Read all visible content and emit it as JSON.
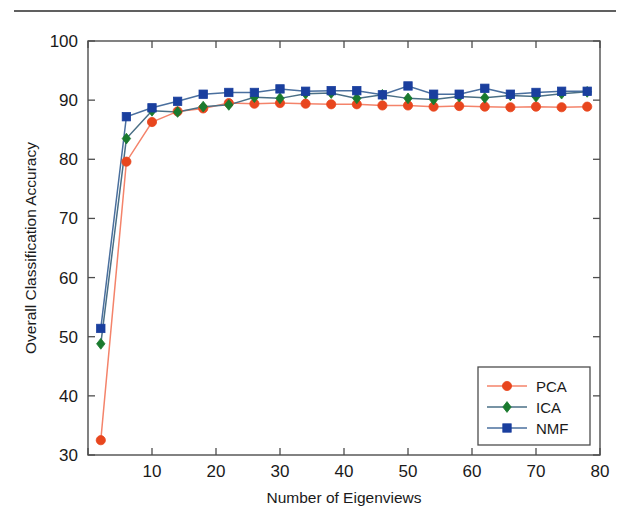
{
  "figure": {
    "top_rule_color": "#606060",
    "background": "#ffffff",
    "axis_color": "#4d4d4d"
  },
  "chart_data": {
    "type": "line",
    "title": "",
    "subtitle": "",
    "xlabel": "Number of Eigenviews",
    "ylabel": "Overall Classification Accuracy",
    "xlim": [
      0,
      80
    ],
    "ylim": [
      30,
      100
    ],
    "xticks": [
      0,
      10,
      20,
      30,
      40,
      50,
      60,
      70,
      80
    ],
    "xtick_labels": [
      "",
      "10",
      "20",
      "30",
      "40",
      "50",
      "60",
      "70",
      "80"
    ],
    "yticks": [
      30,
      40,
      50,
      60,
      70,
      80,
      90,
      100
    ],
    "ytick_labels": [
      "30",
      "40",
      "50",
      "60",
      "70",
      "80",
      "90",
      "100"
    ],
    "grid": false,
    "legend_position": "lower right",
    "x": [
      2,
      6,
      10,
      14,
      18,
      22,
      26,
      30,
      34,
      38,
      42,
      46,
      50,
      54,
      58,
      62,
      66,
      70,
      74,
      78
    ],
    "series": [
      {
        "name": "PCA",
        "color": "#e8461e",
        "line_color": "#f4836a",
        "marker": "circle",
        "values": [
          32.5,
          79.6,
          86.3,
          88.1,
          88.6,
          89.5,
          89.4,
          89.5,
          89.4,
          89.3,
          89.3,
          89.1,
          89.1,
          88.9,
          89.0,
          88.9,
          88.8,
          88.9,
          88.8,
          88.9
        ]
      },
      {
        "name": "ICA",
        "color": "#1a7a2e",
        "line_color": "#4a6f86",
        "marker": "diamond",
        "values": [
          48.8,
          83.5,
          88.2,
          88.0,
          88.9,
          89.2,
          90.5,
          90.3,
          91.1,
          91.2,
          90.3,
          90.9,
          90.3,
          90.1,
          90.6,
          90.4,
          90.8,
          90.6,
          91.1,
          91.4
        ]
      },
      {
        "name": "NMF",
        "color": "#1a3f9e",
        "line_color": "#4a6f9e",
        "marker": "square",
        "values": [
          51.4,
          87.2,
          88.7,
          89.8,
          91.0,
          91.3,
          91.3,
          91.9,
          91.5,
          91.6,
          91.6,
          90.9,
          92.4,
          91.0,
          91.0,
          92.0,
          91.0,
          91.3,
          91.5,
          91.5
        ]
      }
    ],
    "legend": [
      {
        "label": "PCA",
        "color": "#e8461e",
        "line_color": "#f4836a",
        "marker": "circle"
      },
      {
        "label": "ICA",
        "color": "#1a7a2e",
        "line_color": "#4a6f86",
        "marker": "diamond"
      },
      {
        "label": "NMF",
        "color": "#1a3f9e",
        "line_color": "#4a6f9e",
        "marker": "square"
      }
    ]
  }
}
